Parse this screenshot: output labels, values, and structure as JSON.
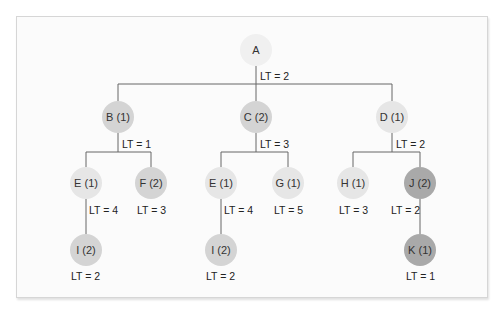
{
  "colors": {
    "level0": "#f0f0f0",
    "light": "#e6e6e6",
    "medium": "#d4d4d4",
    "dark": "#a9a9a9",
    "line": "#666666"
  },
  "nodes": [
    {
      "id": "A",
      "label": "A",
      "x": 256,
      "y": 50,
      "shade": "level0"
    },
    {
      "id": "B",
      "label": "B (1)",
      "x": 118,
      "y": 117,
      "shade": "medium"
    },
    {
      "id": "C",
      "label": "C (2)",
      "x": 256,
      "y": 117,
      "shade": "medium"
    },
    {
      "id": "D",
      "label": "D (1)",
      "x": 392,
      "y": 117,
      "shade": "light"
    },
    {
      "id": "E1",
      "label": "E (1)",
      "x": 86,
      "y": 183,
      "shade": "light"
    },
    {
      "id": "F",
      "label": "F (2)",
      "x": 151,
      "y": 183,
      "shade": "medium"
    },
    {
      "id": "E2",
      "label": "E (1)",
      "x": 221,
      "y": 183,
      "shade": "light"
    },
    {
      "id": "G",
      "label": "G (1)",
      "x": 288,
      "y": 183,
      "shade": "light"
    },
    {
      "id": "H",
      "label": "H (1)",
      "x": 353,
      "y": 183,
      "shade": "light"
    },
    {
      "id": "J",
      "label": "J (2)",
      "x": 420,
      "y": 183,
      "shade": "dark"
    },
    {
      "id": "I1",
      "label": "I (2)",
      "x": 86,
      "y": 250,
      "shade": "medium"
    },
    {
      "id": "I2",
      "label": "I (2)",
      "x": 221,
      "y": 250,
      "shade": "medium"
    },
    {
      "id": "K",
      "label": "K (1)",
      "x": 420,
      "y": 250,
      "shade": "dark"
    }
  ],
  "lead_times": [
    {
      "node": "A",
      "text": "LT = 2",
      "x": 260,
      "y": 70
    },
    {
      "node": "B",
      "text": "LT = 1",
      "x": 122,
      "y": 138
    },
    {
      "node": "C",
      "text": "LT = 3",
      "x": 260,
      "y": 138
    },
    {
      "node": "D",
      "text": "LT = 2",
      "x": 396,
      "y": 138
    },
    {
      "node": "E1",
      "text": "LT = 4",
      "x": 89,
      "y": 204
    },
    {
      "node": "F",
      "text": "LT = 3",
      "x": 137,
      "y": 204
    },
    {
      "node": "E2",
      "text": "LT = 4",
      "x": 224,
      "y": 204
    },
    {
      "node": "G",
      "text": "LT = 5",
      "x": 274,
      "y": 204
    },
    {
      "node": "H",
      "text": "LT = 3",
      "x": 339,
      "y": 204
    },
    {
      "node": "J",
      "text": "LT = 2",
      "x": 391,
      "y": 204
    },
    {
      "node": "I1",
      "text": "LT = 2",
      "x": 71,
      "y": 270
    },
    {
      "node": "I2",
      "text": "LT = 2",
      "x": 206,
      "y": 270
    },
    {
      "node": "K",
      "text": "LT = 1",
      "x": 406,
      "y": 270
    }
  ]
}
